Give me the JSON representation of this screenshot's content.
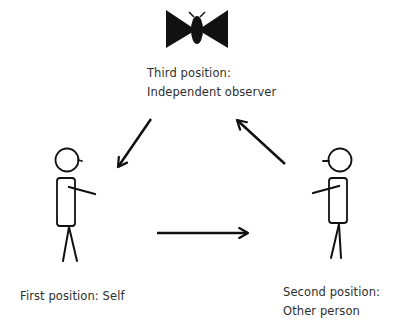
{
  "diagram": {
    "type": "perceptual-positions",
    "colors": {
      "stroke": "#111111",
      "text": "#2e2e2e",
      "background": "#ffffff"
    },
    "nodes": [
      {
        "id": "third",
        "icon": "fly-observer-icon",
        "title": "Third position:",
        "subtitle": "Independent observer"
      },
      {
        "id": "first",
        "icon": "stick-figure-self-icon",
        "title": "First position:",
        "subtitle": "Self"
      },
      {
        "id": "second",
        "icon": "stick-figure-other-icon",
        "title": "Second position:",
        "subtitle": "Other person"
      }
    ],
    "edges": [
      {
        "from": "third",
        "to": "first"
      },
      {
        "from": "first",
        "to": "second"
      },
      {
        "from": "second",
        "to": "third"
      }
    ]
  }
}
